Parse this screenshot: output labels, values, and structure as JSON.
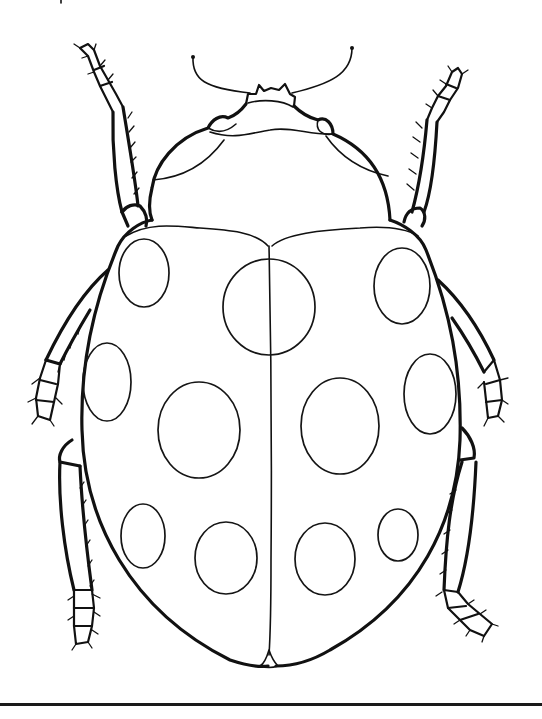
{
  "image": {
    "subject": "ladybug line-art coloring page",
    "background": "#ffffff",
    "line_color": "#111111",
    "spot_count": 13
  },
  "drawing": {
    "spots": [
      {
        "cx": 144,
        "cy": 273,
        "rx": 25,
        "ry": 34
      },
      {
        "cx": 269,
        "cy": 307,
        "rx": 46,
        "ry": 48
      },
      {
        "cx": 402,
        "cy": 286,
        "rx": 28,
        "ry": 38
      },
      {
        "cx": 107,
        "cy": 382,
        "rx": 24,
        "ry": 39
      },
      {
        "cx": 199,
        "cy": 430,
        "rx": 41,
        "ry": 48
      },
      {
        "cx": 340,
        "cy": 426,
        "rx": 39,
        "ry": 48
      },
      {
        "cx": 430,
        "cy": 394,
        "rx": 26,
        "ry": 40
      },
      {
        "cx": 143,
        "cy": 536,
        "rx": 22,
        "ry": 32
      },
      {
        "cx": 226,
        "cy": 558,
        "rx": 31,
        "ry": 36
      },
      {
        "cx": 325,
        "cy": 559,
        "rx": 30,
        "ry": 36
      },
      {
        "cx": 398,
        "cy": 535,
        "rx": 20,
        "ry": 26
      }
    ]
  }
}
